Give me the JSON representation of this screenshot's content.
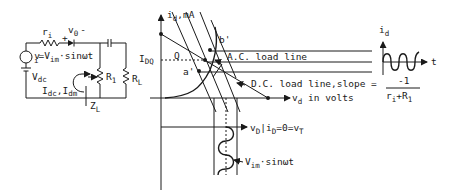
{
  "circuit": {
    "source_resistor": {
      "main": "r",
      "sub": "i"
    },
    "diode_voltage": {
      "plus": "+",
      "main": "v",
      "sub": "0",
      "minus": "-"
    },
    "source_voltage": {
      "lead": "v",
      "sub": "i",
      "eq": "=V",
      "sub2": "im",
      "tail": "·sinωt"
    },
    "dc_source": {
      "main": "V",
      "sub": "dc"
    },
    "currents": {
      "a": "I",
      "a_sub": "dc",
      "comma": ",",
      "b": "I",
      "b_sub": "dm"
    },
    "r_1": {
      "main": "R",
      "sub": "1"
    },
    "r_L": {
      "main": "R",
      "sub": "L"
    },
    "z_L": {
      "main": "Z",
      "sub": "L"
    }
  },
  "graph": {
    "y_axis": {
      "main": "i",
      "sub": "d",
      "unit": ",mA"
    },
    "x_axis": {
      "main": "v",
      "sub": "d",
      "unit": " in volts"
    },
    "idq": {
      "main": "I",
      "sub": "DQ"
    },
    "q_point": "Q",
    "a_prime": "a'",
    "b_prime": "b'",
    "ac_load_line": "A.C. load line",
    "dc_load_line": "D.C. load line,slope =",
    "slope_num": "-1",
    "slope_den": {
      "a": "r",
      "a_sub": "i",
      "plus": "+R",
      "b_sub": "1"
    },
    "bottom_label": {
      "main": "v",
      "sub": "D",
      "bar": "|i",
      "sub2": "D",
      "tail": "=0=v",
      "sub3": "T"
    },
    "bottom_wave": {
      "main": "V",
      "sub": "im",
      "tail": "·sinωt"
    }
  },
  "waveform": {
    "y_axis": {
      "main": "i",
      "sub": "d"
    },
    "x_axis": "t"
  }
}
